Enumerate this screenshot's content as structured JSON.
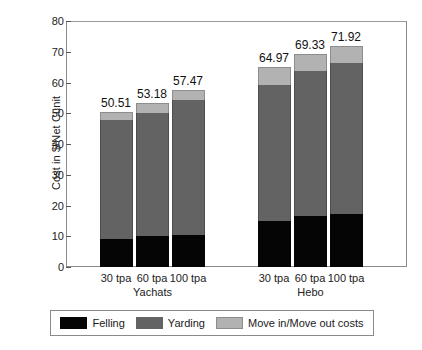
{
  "chart_data": {
    "type": "bar",
    "subtype": "stacked-bar",
    "title": "",
    "xlabel": "",
    "ylabel": "Cost in $/Net Cunit",
    "ylim": [
      0,
      80
    ],
    "ytick_step": 10,
    "yticks": [
      "80",
      "70",
      "60",
      "50",
      "40",
      "30",
      "20",
      "10",
      "0"
    ],
    "grid": false,
    "legend_position": "bottom",
    "groups": [
      {
        "name": "Yachats",
        "categories": [
          "30 tpa",
          "60 tpa",
          "100 tpa"
        ]
      },
      {
        "name": "Hebo",
        "categories": [
          "30 tpa",
          "60 tpa",
          "100 tpa"
        ]
      }
    ],
    "categories": [
      "30 tpa",
      "60 tpa",
      "100 tpa",
      "30 tpa",
      "60 tpa",
      "100 tpa"
    ],
    "series": [
      {
        "name": "Felling",
        "color": "#050505",
        "values": [
          9.2,
          10.0,
          10.3,
          15.0,
          16.5,
          17.3
        ]
      },
      {
        "name": "Yarding",
        "color": "#636363",
        "values": [
          38.6,
          40.2,
          44.0,
          44.2,
          47.2,
          48.9
        ]
      },
      {
        "name": "Move in/Move out costs",
        "color": "#b2b2b2",
        "values": [
          2.71,
          2.98,
          3.17,
          5.77,
          5.63,
          5.72
        ]
      }
    ],
    "totals": [
      50.51,
      53.18,
      57.47,
      64.97,
      69.33,
      71.92
    ],
    "total_labels": [
      "50.51",
      "53.18",
      "57.47",
      "64.97",
      "69.33",
      "71.92"
    ],
    "legend": [
      {
        "label": "Felling",
        "color": "#050505",
        "swatch": "felling-swatch"
      },
      {
        "label": "Yarding",
        "color": "#636363",
        "swatch": "yarding-swatch"
      },
      {
        "label": "Move in/Move out costs",
        "color": "#b2b2b2",
        "swatch": "move-swatch"
      }
    ]
  }
}
